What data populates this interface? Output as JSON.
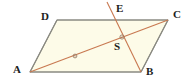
{
  "figure": {
    "kind": "geometry-diagram",
    "shape_name": "parallelogram",
    "width": 196,
    "height": 82,
    "background_color": "#ffffff",
    "fill_color": "#fdfbe8",
    "edge_color": "#8a8a82",
    "diagonal_color": "#c87850",
    "label_color": "#1d1d1d",
    "marker_color": "#9a7d66"
  },
  "labels": {
    "a": "A",
    "b": "B",
    "c": "C",
    "d": "D",
    "e": "E",
    "s": "S"
  },
  "label_positions": {
    "a": {
      "x": 13,
      "y": 64
    },
    "b": {
      "x": 146,
      "y": 66
    },
    "c": {
      "x": 173,
      "y": 9
    },
    "d": {
      "x": 41,
      "y": 11
    },
    "e": {
      "x": 116,
      "y": 3
    },
    "s": {
      "x": 114,
      "y": 41
    }
  },
  "points": {
    "a": {
      "x": 30,
      "y": 72
    },
    "b": {
      "x": 141,
      "y": 72
    },
    "c": {
      "x": 168,
      "y": 20
    },
    "d": {
      "x": 57,
      "y": 20
    },
    "e": {
      "x": 107,
      "y": 2
    },
    "s": {
      "x": 122,
      "y": 37
    }
  },
  "segments": {
    "parallelogram_outline": "30,72 57,20 168,20 141,72",
    "diagonal_ac": {
      "x1": 30,
      "y1": 72,
      "x2": 168,
      "y2": 20
    },
    "line_eb": {
      "x1": 107,
      "y1": 2,
      "x2": 141,
      "y2": 72
    }
  },
  "markers": {
    "midpoint_as_tick": {
      "x": 75,
      "y": 56
    },
    "intersection_tick": {
      "x": 122,
      "y": 37
    }
  }
}
